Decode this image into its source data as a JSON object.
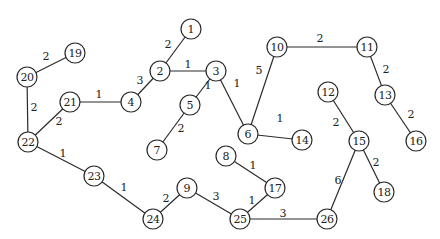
{
  "diagram": {
    "type": "weighted-undirected-graph",
    "colors": {
      "stroke": "#2a2a2a",
      "text": "#222222",
      "background": "#ffffff"
    },
    "node_radius": 10,
    "nodes": [
      {
        "id": "1",
        "x": 191,
        "y": 29
      },
      {
        "id": "2",
        "x": 160,
        "y": 71
      },
      {
        "id": "3",
        "x": 216,
        "y": 71
      },
      {
        "id": "4",
        "x": 131,
        "y": 102
      },
      {
        "id": "5",
        "x": 190,
        "y": 105
      },
      {
        "id": "6",
        "x": 248,
        "y": 134
      },
      {
        "id": "7",
        "x": 157,
        "y": 150
      },
      {
        "id": "8",
        "x": 226,
        "y": 156
      },
      {
        "id": "9",
        "x": 187,
        "y": 188
      },
      {
        "id": "10",
        "x": 277,
        "y": 47
      },
      {
        "id": "11",
        "x": 367,
        "y": 47
      },
      {
        "id": "12",
        "x": 328,
        "y": 92
      },
      {
        "id": "13",
        "x": 385,
        "y": 95
      },
      {
        "id": "14",
        "x": 302,
        "y": 140
      },
      {
        "id": "15",
        "x": 359,
        "y": 141
      },
      {
        "id": "16",
        "x": 416,
        "y": 141
      },
      {
        "id": "17",
        "x": 275,
        "y": 188
      },
      {
        "id": "18",
        "x": 384,
        "y": 192
      },
      {
        "id": "19",
        "x": 75,
        "y": 53
      },
      {
        "id": "20",
        "x": 27,
        "y": 77
      },
      {
        "id": "21",
        "x": 70,
        "y": 102
      },
      {
        "id": "22",
        "x": 28,
        "y": 142
      },
      {
        "id": "23",
        "x": 94,
        "y": 176
      },
      {
        "id": "24",
        "x": 153,
        "y": 219
      },
      {
        "id": "25",
        "x": 240,
        "y": 219
      },
      {
        "id": "26",
        "x": 327,
        "y": 219
      }
    ],
    "edges": [
      {
        "from": "19",
        "to": "20",
        "weight": "2",
        "lx": 46,
        "ly": 60
      },
      {
        "from": "20",
        "to": "22",
        "weight": "2",
        "lx": 34,
        "ly": 111
      },
      {
        "from": "22",
        "to": "21",
        "weight": "2",
        "lx": 59,
        "ly": 125
      },
      {
        "from": "21",
        "to": "4",
        "weight": "1",
        "lx": 99,
        "ly": 98
      },
      {
        "from": "4",
        "to": "2",
        "weight": "3",
        "lx": 140,
        "ly": 84
      },
      {
        "from": "2",
        "to": "1",
        "weight": "2",
        "lx": 168,
        "ly": 48
      },
      {
        "from": "2",
        "to": "3",
        "weight": "1",
        "lx": 188,
        "ly": 68
      },
      {
        "from": "3",
        "to": "5",
        "weight": "1",
        "lx": 208,
        "ly": 89
      },
      {
        "from": "3",
        "to": "6",
        "weight": "1",
        "lx": 237,
        "ly": 87
      },
      {
        "from": "5",
        "to": "7",
        "weight": "2",
        "lx": 181,
        "ly": 132
      },
      {
        "from": "6",
        "to": "10",
        "weight": "5",
        "lx": 259,
        "ly": 74
      },
      {
        "from": "6",
        "to": "14",
        "weight": "1",
        "lx": 280,
        "ly": 122
      },
      {
        "from": "10",
        "to": "11",
        "weight": "2",
        "lx": 320,
        "ly": 42
      },
      {
        "from": "11",
        "to": "13",
        "weight": "2",
        "lx": 386,
        "ly": 73
      },
      {
        "from": "13",
        "to": "16",
        "weight": "2",
        "lx": 411,
        "ly": 118
      },
      {
        "from": "12",
        "to": "15",
        "weight": "2",
        "lx": 336,
        "ly": 126
      },
      {
        "from": "15",
        "to": "18",
        "weight": "2",
        "lx": 376,
        "ly": 166
      },
      {
        "from": "15",
        "to": "26",
        "weight": "6",
        "lx": 338,
        "ly": 184
      },
      {
        "from": "22",
        "to": "23",
        "weight": "1",
        "lx": 63,
        "ly": 157
      },
      {
        "from": "23",
        "to": "24",
        "weight": "1",
        "lx": 124,
        "ly": 191
      },
      {
        "from": "24",
        "to": "9",
        "weight": "2",
        "lx": 166,
        "ly": 202
      },
      {
        "from": "9",
        "to": "25",
        "weight": "3",
        "lx": 216,
        "ly": 200
      },
      {
        "from": "8",
        "to": "17",
        "weight": "1",
        "lx": 253,
        "ly": 169
      },
      {
        "from": "17",
        "to": "25",
        "weight": "1",
        "lx": 252,
        "ly": 204
      },
      {
        "from": "25",
        "to": "26",
        "weight": "3",
        "lx": 283,
        "ly": 217
      }
    ]
  }
}
